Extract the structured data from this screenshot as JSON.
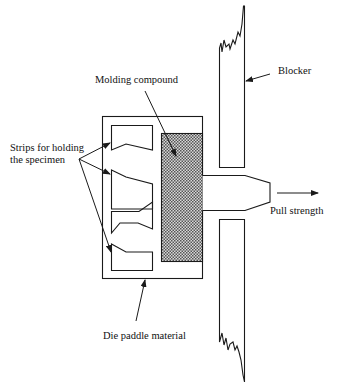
{
  "labels": {
    "molding_compound": "Molding compound",
    "blocker": "Blocker",
    "strips_line1": "Strips for holding",
    "strips_line2": "the specimen",
    "pull_strength": "Pull strength",
    "die_paddle": "Die paddle material"
  },
  "colors": {
    "line": "#1a1a1a",
    "hatch_dark": "#555555",
    "hatch_light": "#d8d8d8",
    "background": "#ffffff"
  }
}
